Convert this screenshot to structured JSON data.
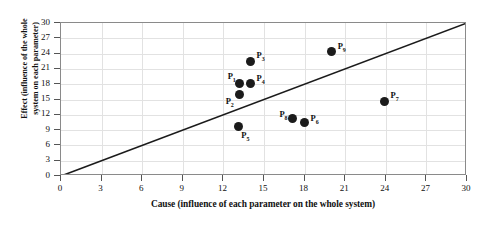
{
  "chart_data": {
    "type": "scatter",
    "title": "",
    "xlabel": "Cause (influence of each parameter on the whole system)",
    "ylabel_line1": "Effect (influence of the whole",
    "ylabel_line2": "system on each parameter)",
    "xlim": [
      0,
      30
    ],
    "ylim": [
      0,
      30
    ],
    "xticks": [
      0,
      3,
      6,
      9,
      12,
      15,
      18,
      21,
      24,
      27,
      30
    ],
    "yticks": [
      0,
      3,
      6,
      9,
      12,
      15,
      18,
      21,
      24,
      27,
      30
    ],
    "grid": true,
    "legend": "none",
    "reference_line": {
      "name": "y = x diagonal",
      "from": [
        0,
        0
      ],
      "to": [
        30,
        30
      ],
      "color": "#1b1b1b"
    },
    "point_color": "#1b1b1b",
    "points": [
      {
        "label": "P",
        "sub": "1",
        "x": 13.2,
        "y": 18.2,
        "label_dx": -12,
        "label_dy": -12
      },
      {
        "label": "P",
        "sub": "2",
        "x": 13.2,
        "y": 15.9,
        "label_dx": -14,
        "label_dy": 1
      },
      {
        "label": "P",
        "sub": "3",
        "x": 14.0,
        "y": 22.5,
        "label_dx": 6,
        "label_dy": -11
      },
      {
        "label": "P",
        "sub": "4",
        "x": 14.0,
        "y": 18.2,
        "label_dx": 6,
        "label_dy": -10
      },
      {
        "label": "P",
        "sub": "5",
        "x": 13.1,
        "y": 9.8,
        "label_dx": 3,
        "label_dy": 4
      },
      {
        "label": "P",
        "sub": "6",
        "x": 18.0,
        "y": 10.4,
        "label_dx": 6,
        "label_dy": -10
      },
      {
        "label": "P",
        "sub": "7",
        "x": 23.9,
        "y": 14.7,
        "label_dx": 6,
        "label_dy": -11
      },
      {
        "label": "P",
        "sub": "8",
        "x": 17.1,
        "y": 11.2,
        "label_dx": -13,
        "label_dy": -10
      },
      {
        "label": "P",
        "sub": "9",
        "x": 20.0,
        "y": 24.5,
        "label_dx": 6,
        "label_dy": -10
      }
    ]
  }
}
